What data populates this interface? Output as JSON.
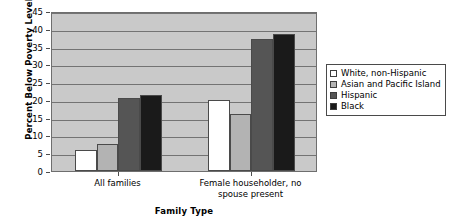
{
  "chart_data": {
    "type": "bar",
    "title": "",
    "subtitle": "",
    "xlabel": "Family Type",
    "ylabel": "Percent Below Poverty Level",
    "categories": [
      "All families",
      "Female householder, no spouse present"
    ],
    "series": [
      {
        "name": "White, non-Hispanic",
        "color": "#ffffff",
        "values": [
          6,
          20
        ]
      },
      {
        "name": "Asian and Pacific Island",
        "color": "#b3b3b3",
        "values": [
          7.5,
          16
        ]
      },
      {
        "name": "Hispanic",
        "color": "#555555",
        "values": [
          20.5,
          37
        ]
      },
      {
        "name": "Black",
        "color": "#1a1a1a",
        "values": [
          21.5,
          38.5
        ]
      }
    ],
    "ylim": [
      0,
      45
    ],
    "ytick_step": 5,
    "yticks": [
      0,
      5,
      10,
      15,
      20,
      25,
      30,
      35,
      40,
      45
    ],
    "grid": true,
    "grid_axis": "y",
    "legend_position": "right",
    "plot_background": "#c9c9c9",
    "grid_color": "#737373",
    "axis_color": "#6e6e6e"
  },
  "legend": {
    "items": [
      {
        "label": "White, non-Hispanic",
        "color": "#ffffff"
      },
      {
        "label": "Asian and Pacific Island",
        "color": "#b3b3b3"
      },
      {
        "label": "Hispanic",
        "color": "#555555"
      },
      {
        "label": "Black",
        "color": "#1a1a1a"
      }
    ]
  },
  "axes": {
    "y_title": "Percent Below Poverty Level",
    "x_title": "Family Type",
    "y_tick_labels": [
      "45",
      "40",
      "35",
      "30",
      "25",
      "20",
      "15",
      "10",
      "5",
      "0"
    ],
    "x_tick_labels": [
      "All families",
      "Female householder, no spouse present"
    ]
  }
}
